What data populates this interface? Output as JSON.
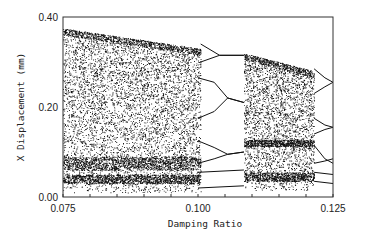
{
  "chart_data": {
    "type": "scatter",
    "title": "",
    "xlabel": "Damping Ratio",
    "ylabel": "X Displacement (mm)",
    "xlim": [
      0.075,
      0.125
    ],
    "ylim": [
      0.0,
      0.4
    ],
    "x_ticks": [
      0.075,
      0.1,
      0.125
    ],
    "x_tick_labels": [
      "0.075",
      "0.100",
      "0.125"
    ],
    "x_minor_tick_step": 0.005,
    "y_ticks": [
      0.0,
      0.2,
      0.4
    ],
    "y_tick_labels": [
      "0.00",
      "0.20",
      "0.40"
    ],
    "grid": false,
    "legend": null,
    "chaotic_regions": [
      {
        "x_start": 0.075,
        "x_end": 0.1005,
        "y_upper_start": 0.375,
        "y_upper_end": 0.33,
        "y_lower": 0.01
      },
      {
        "x_start": 0.1085,
        "x_end": 0.1215,
        "y_upper_start": 0.32,
        "y_upper_end": 0.28,
        "y_lower": 0.015
      }
    ],
    "periodic_branches": [
      {
        "x": [
          0.1005,
          0.104,
          0.1085
        ],
        "y": [
          0.34,
          0.315,
          0.315
        ]
      },
      {
        "x": [
          0.1005,
          0.104,
          0.1085
        ],
        "y": [
          0.3,
          0.315,
          0.315
        ]
      },
      {
        "x": [
          0.1,
          0.103,
          0.1055,
          0.1085
        ],
        "y": [
          0.265,
          0.255,
          0.22,
          0.21
        ]
      },
      {
        "x": [
          0.1,
          0.103,
          0.1055,
          0.1085
        ],
        "y": [
          0.175,
          0.19,
          0.22,
          0.21
        ]
      },
      {
        "x": [
          0.1,
          0.103,
          0.1055,
          0.1085
        ],
        "y": [
          0.125,
          0.11,
          0.095,
          0.1
        ]
      },
      {
        "x": [
          0.1,
          0.103,
          0.1055,
          0.1085
        ],
        "y": [
          0.075,
          0.085,
          0.095,
          0.1
        ]
      },
      {
        "x": [
          0.1,
          0.1085
        ],
        "y": [
          0.055,
          0.06
        ]
      },
      {
        "x": [
          0.1,
          0.1085
        ],
        "y": [
          0.02,
          0.025
        ]
      },
      {
        "x": [
          0.1215,
          0.1235,
          0.125
        ],
        "y": [
          0.285,
          0.265,
          0.255
        ]
      },
      {
        "x": [
          0.1215,
          0.1235,
          0.125
        ],
        "y": [
          0.23,
          0.245,
          0.255
        ]
      },
      {
        "x": [
          0.1215,
          0.1235,
          0.125
        ],
        "y": [
          0.175,
          0.16,
          0.155
        ]
      },
      {
        "x": [
          0.1215,
          0.1235,
          0.125
        ],
        "y": [
          0.14,
          0.15,
          0.155
        ]
      },
      {
        "x": [
          0.1215,
          0.1235,
          0.125
        ],
        "y": [
          0.115,
          0.085,
          0.075
        ]
      },
      {
        "x": [
          0.1215,
          0.1235,
          0.125
        ],
        "y": [
          0.075,
          0.08,
          0.085
        ]
      },
      {
        "x": [
          0.1215,
          0.125
        ],
        "y": [
          0.055,
          0.05
        ]
      },
      {
        "x": [
          0.1215,
          0.125
        ],
        "y": [
          0.035,
          0.03
        ]
      }
    ],
    "dense_bands": [
      {
        "x_start": 0.075,
        "x_end": 0.1005,
        "y": 0.075,
        "width": 0.03
      },
      {
        "x_start": 0.075,
        "x_end": 0.1005,
        "y": 0.04,
        "width": 0.02
      },
      {
        "x_start": 0.1085,
        "x_end": 0.1215,
        "y": 0.045,
        "width": 0.02
      },
      {
        "x_start": 0.1085,
        "x_end": 0.1215,
        "y": 0.12,
        "width": 0.015
      }
    ],
    "point_color": "#111111",
    "frame_color": "#333333"
  }
}
